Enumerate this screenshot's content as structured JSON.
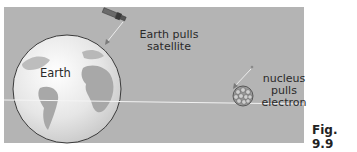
{
  "figure": {
    "caption": "Fig. 9.9",
    "background_color": "#b4b4b4"
  },
  "labels": {
    "earth": "Earth",
    "satellite_line1": "Earth pulls",
    "satellite_line2": "satellite",
    "nucleus_line1": "nucleus",
    "nucleus_line2": "pulls",
    "nucleus_line3": "electron"
  },
  "objects": {
    "earth": "globe-icon",
    "satellite": "satellite-icon",
    "nucleus": "nucleus-icon",
    "electron": "electron-dot"
  }
}
